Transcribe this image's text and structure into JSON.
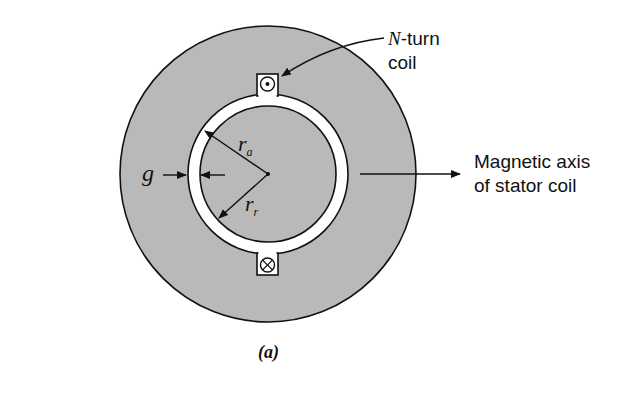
{
  "figure": {
    "caption": "(a)",
    "colors": {
      "iron": "#b9b9b9",
      "air_gap": "#ffffff",
      "line": "#111111",
      "background": "#ffffff"
    },
    "geometry": {
      "center": [
        268,
        174
      ],
      "stator_outer_radius": 148,
      "stator_inner_radius": 80,
      "rotor_radius": 68
    },
    "labels": {
      "coil_label_prefix": "N",
      "coil_label_suffix": "-turn",
      "coil_label_line2": "coil",
      "axis_label_line1": "Magnetic axis",
      "axis_label_line2": "of stator coil",
      "gap_symbol": "g",
      "rotor_outer_radius_symbol": "r",
      "rotor_outer_radius_subscript": "a",
      "rotor_radius_symbol": "r",
      "rotor_radius_subscript": "r"
    },
    "coil_sides": [
      {
        "position": "top",
        "symbol": "dot",
        "meaning": "current out of page"
      },
      {
        "position": "bottom",
        "symbol": "cross",
        "meaning": "current into page"
      }
    ]
  }
}
